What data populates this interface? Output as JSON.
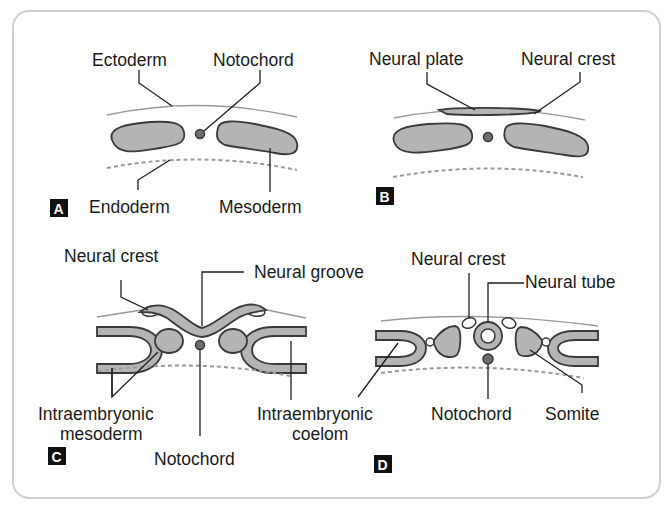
{
  "figure": {
    "panels": {
      "A": {
        "tag": "A",
        "labels": {
          "ectoderm": "Ectoderm",
          "notochord": "Notochord",
          "endoderm": "Endoderm",
          "mesoderm": "Mesoderm"
        }
      },
      "B": {
        "tag": "B",
        "labels": {
          "neural_plate": "Neural plate",
          "neural_crest": "Neural crest"
        }
      },
      "C": {
        "tag": "C",
        "labels": {
          "neural_crest": "Neural crest",
          "neural_groove": "Neural groove",
          "intraembryonic_mesoderm_line1": "Intraembryonic",
          "intraembryonic_mesoderm_line2": "mesoderm",
          "notochord": "Notochord",
          "intraembryonic_coelom_line1": "Intraembryonic",
          "intraembryonic_coelom_line2": "coelom"
        }
      },
      "D": {
        "tag": "D",
        "labels": {
          "neural_crest": "Neural crest",
          "neural_tube": "Neural tube",
          "notochord": "Notochord",
          "somite": "Somite"
        }
      }
    },
    "colors": {
      "tissue_fill": "#b4b4b4",
      "outline": "#3a3a3a",
      "notochord_fill": "#6e6e6e",
      "ectoderm_line": "#9a9a9a",
      "tag_bg": "#111111",
      "frame": "#cfcfcf"
    }
  }
}
